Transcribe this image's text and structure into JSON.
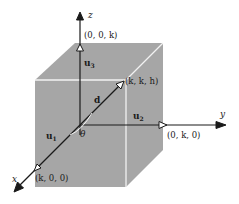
{
  "figure": {
    "axes": {
      "x": "x",
      "y": "y",
      "z": "z"
    },
    "points": {
      "z_point": "(0, 0, k)",
      "diag_point": "(k, k, h)",
      "y_point": "(0, k, 0)",
      "x_point": "(k, 0, 0)"
    },
    "vectors": {
      "u1": {
        "base": "u",
        "sub": "1"
      },
      "u2": {
        "base": "u",
        "sub": "2"
      },
      "u3": {
        "base": "u",
        "sub": "3"
      },
      "d": "d"
    },
    "angle": "θ",
    "colors": {
      "cube_fill": "#a6a6a6",
      "cube_edge": "#f2f2f2",
      "axis": "#1a1a1a",
      "background": "#ffffff"
    }
  }
}
